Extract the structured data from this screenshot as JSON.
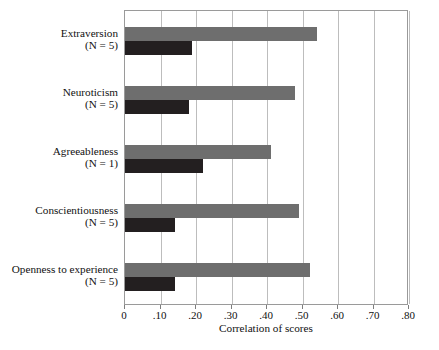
{
  "chart_data": {
    "type": "bar",
    "orientation": "horizontal",
    "title": "",
    "xlabel": "Correlation of scores",
    "ylabel": "",
    "xlim": [
      0,
      0.8
    ],
    "xticks": [
      0,
      0.1,
      0.2,
      0.3,
      0.4,
      0.5,
      0.6,
      0.7,
      0.8
    ],
    "xticklabels": [
      "0",
      ".10",
      ".20",
      ".30",
      ".40",
      ".50",
      ".60",
      ".70",
      ".80"
    ],
    "grid": "vertical",
    "legend": "none",
    "categories": [
      "Extraversion",
      "Neuroticism",
      "Agreeableness",
      "Conscientiousness",
      "Openness to experience"
    ],
    "category_annotations": [
      "(N = 5)",
      "(N = 5)",
      "(N = 1)",
      "(N = 5)",
      "(N = 5)"
    ],
    "series": [
      {
        "name": "upper-bar",
        "color": "#6e6e6e",
        "values": [
          0.54,
          0.48,
          0.41,
          0.49,
          0.52
        ]
      },
      {
        "name": "lower-bar",
        "color": "#231f20",
        "values": [
          0.19,
          0.18,
          0.22,
          0.14,
          0.14
        ]
      }
    ]
  },
  "axis": {
    "x_title": "Correlation of scores"
  },
  "colors": {
    "upper_bar": "#6e6e6e",
    "lower_bar": "#231f20",
    "gridline": "#bdbdbd",
    "frame": "#9a9a9a",
    "background": "#ffffff",
    "text": "#111111"
  }
}
